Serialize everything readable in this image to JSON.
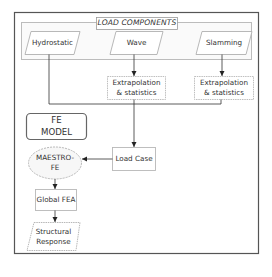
{
  "diagram": {
    "group_title": "LOAD COMPONENTS",
    "nodes": {
      "hydrostatic": "Hydrostatic",
      "wave": "Wave",
      "slamming": "Slamming",
      "extrap_wave": "Extrapolation\n& statistics",
      "extrap_slamming": "Extrapolation\n& statistics",
      "fe_model": "FE\nMODEL",
      "load_case": "Load Case",
      "maestro": "MAESTRO-\nFE",
      "global_fea": "Global FEA",
      "structural_response": "Structural\nResponse"
    },
    "edges": [
      {
        "from": "wave",
        "to": "extrap_wave"
      },
      {
        "from": "slamming",
        "to": "extrap_slamming"
      },
      {
        "from": "hydrostatic",
        "to": "load_case"
      },
      {
        "from": "extrap_wave",
        "to": "load_case"
      },
      {
        "from": "extrap_slamming",
        "to": "load_case"
      },
      {
        "from": "load_case",
        "to": "maestro"
      },
      {
        "from": "maestro",
        "to": "global_fea"
      },
      {
        "from": "global_fea",
        "to": "structural_response"
      }
    ],
    "colors": {
      "frame": "#555555",
      "box_border": "#b0b0b0",
      "line": "#333333",
      "text": "#333333"
    }
  }
}
